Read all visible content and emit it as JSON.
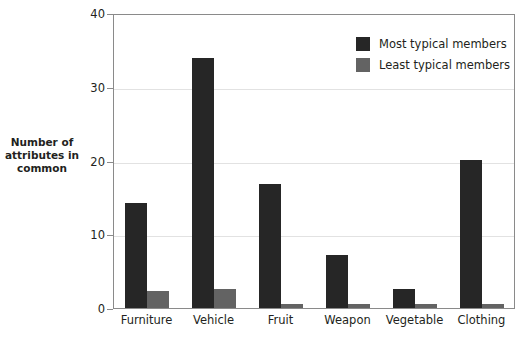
{
  "chart_data": {
    "type": "bar",
    "title": "",
    "xlabel": "",
    "ylabel": "Number of attributes in common",
    "ylabel_lines": [
      "Number of",
      "attributes in",
      "common"
    ],
    "categories": [
      "Furniture",
      "Vehicle",
      "Fruit",
      "Weapon",
      "Vegetable",
      "Clothing"
    ],
    "series": [
      {
        "name": "Most typical members",
        "color": "#262626",
        "values": [
          14.2,
          33.9,
          16.8,
          7.2,
          2.6,
          20.1
        ]
      },
      {
        "name": "Least typical members",
        "color": "#636363",
        "values": [
          2.3,
          2.6,
          0.6,
          0.5,
          0.5,
          0.5
        ]
      }
    ],
    "ylim": [
      0,
      40
    ],
    "yticks": [
      0,
      10,
      20,
      30,
      40
    ],
    "ytick_labels": [
      "0",
      "10",
      "20",
      "30",
      "40"
    ],
    "grid": true,
    "grid_axis": "y",
    "legend_position": "top-right",
    "bar_orientation": "vertical"
  },
  "legend": {
    "entries": [
      {
        "label": "Most typical members",
        "color": "#262626"
      },
      {
        "label": "Least typical members",
        "color": "#636363"
      }
    ]
  },
  "colors": {
    "most_typical": "#262626",
    "least_typical": "#636363",
    "gridline": "#e2e2e2",
    "axis": "#8a8a8a",
    "text": "#231f20",
    "background": "#ffffff"
  }
}
